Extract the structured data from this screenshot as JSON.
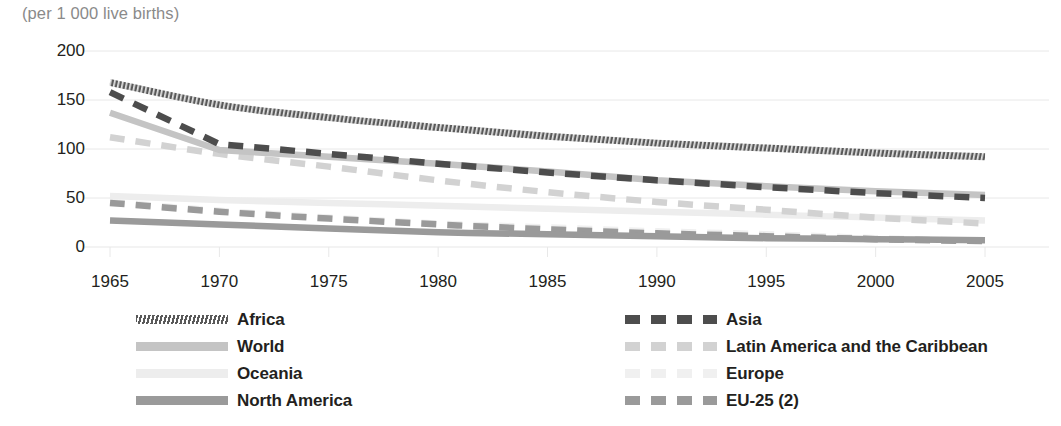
{
  "subtitle": "(per 1 000 live births)",
  "colors": {
    "africa": "#595959",
    "asia": "#4d4d4d",
    "world": "#c4c4c4",
    "latin_america": "#d2d2d2",
    "oceania": "#ededed",
    "europe": "#f0f0f0",
    "north_america": "#9a9a9a",
    "eu25": "#9a9a9a",
    "grid": "#e8e8e8",
    "axis_text": "#231f20",
    "subtitle_text": "#8a8a8a"
  },
  "axes": {
    "y_ticks": [
      "200",
      "150",
      "100",
      "50",
      "0"
    ],
    "x_ticks": [
      "1965",
      "1970",
      "1975",
      "1980",
      "1985",
      "1990",
      "1995",
      "2000",
      "2005"
    ]
  },
  "legend": {
    "left_column": [
      {
        "label": "Africa",
        "series": "africa"
      },
      {
        "label": "World",
        "series": "world"
      },
      {
        "label": "Oceania",
        "series": "oceania"
      },
      {
        "label": "North America",
        "series": "north_america"
      }
    ],
    "right_column": [
      {
        "label": "Asia",
        "series": "asia"
      },
      {
        "label": "Latin America and the Caribbean",
        "series": "latin_america"
      },
      {
        "label": "Europe",
        "series": "europe"
      },
      {
        "label": "EU-25 (2)",
        "series": "eu25"
      }
    ]
  },
  "chart_data": {
    "type": "line",
    "title": "",
    "subtitle": "(per 1 000 live births)",
    "xlabel": "",
    "ylabel": "(per 1 000 live births)",
    "xlim": [
      1965,
      2005
    ],
    "ylim": [
      0,
      200
    ],
    "y_ticks": [
      0,
      50,
      100,
      150,
      200
    ],
    "x_ticks": [
      1965,
      1970,
      1975,
      1980,
      1985,
      1990,
      1995,
      2000,
      2005
    ],
    "grid": "horizontal",
    "legend_position": "bottom",
    "x": [
      1965,
      1970,
      1975,
      1980,
      1985,
      1990,
      1995,
      2000,
      2005
    ],
    "series": [
      {
        "name": "Africa",
        "style": "solid-hatched",
        "color": "#595959",
        "values": [
          168,
          145,
          132,
          122,
          113,
          106,
          101,
          96,
          92
        ]
      },
      {
        "name": "Asia",
        "style": "dashed",
        "color": "#4d4d4d",
        "values": [
          158,
          105,
          95,
          85,
          76,
          68,
          61,
          55,
          50
        ]
      },
      {
        "name": "World",
        "style": "solid",
        "color": "#c4c4c4",
        "values": [
          137,
          99,
          92,
          85,
          77,
          68,
          62,
          57,
          53
        ]
      },
      {
        "name": "Latin America and the Caribbean",
        "style": "dashed",
        "color": "#d2d2d2",
        "values": [
          112,
          95,
          82,
          68,
          56,
          46,
          38,
          30,
          24
        ]
      },
      {
        "name": "Oceania",
        "style": "solid",
        "color": "#ededed",
        "values": [
          52,
          48,
          45,
          42,
          39,
          36,
          33,
          30,
          27
        ]
      },
      {
        "name": "Europe",
        "style": "dashed",
        "color": "#f0f0f0",
        "values": [
          46,
          37,
          30,
          24,
          20,
          16,
          13,
          9,
          6
        ]
      },
      {
        "name": "EU-25 (2)",
        "style": "dashed",
        "color": "#9a9a9a",
        "values": [
          45,
          36,
          29,
          23,
          18,
          14,
          11,
          8,
          6
        ]
      },
      {
        "name": "North America",
        "style": "solid",
        "color": "#9a9a9a",
        "values": [
          27,
          23,
          19,
          15,
          13,
          11,
          9,
          8,
          7
        ]
      }
    ]
  }
}
